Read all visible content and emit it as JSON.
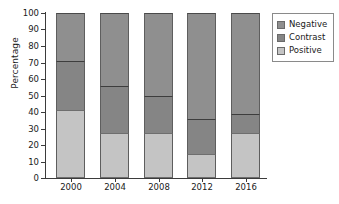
{
  "chart_data": {
    "type": "bar",
    "subtype": "stacked-100-percent",
    "title": "",
    "subtitle": "",
    "xlabel": "",
    "ylabel": "Percentage",
    "categories": [
      "2000",
      "2004",
      "2008",
      "2012",
      "2016"
    ],
    "series": [
      {
        "name": "Positive",
        "color": "#c4c4c4",
        "values": [
          41.0,
          27.0,
          27.5,
          14.5,
          27.0
        ]
      },
      {
        "name": "Contrast",
        "color": "#858585",
        "values": [
          30.0,
          29.0,
          22.5,
          21.5,
          12.0
        ]
      },
      {
        "name": "Negative",
        "color": "#8f8f8f",
        "values": [
          29.0,
          44.0,
          50.0,
          64.0,
          61.0
        ]
      }
    ],
    "stack_order_bottom_to_top": [
      "Positive",
      "Contrast",
      "Negative"
    ],
    "cumulative_tops": {
      "2000": {
        "positive": 41.0,
        "contrast": 71.0,
        "negative": 100.0
      },
      "2004": {
        "positive": 27.0,
        "contrast": 56.0,
        "negative": 100.0
      },
      "2008": {
        "positive": 27.5,
        "contrast": 50.0,
        "negative": 100.0
      },
      "2012": {
        "positive": 14.5,
        "contrast": 36.0,
        "negative": 100.0
      },
      "2016": {
        "positive": 27.0,
        "contrast": 39.0,
        "negative": 100.0
      }
    },
    "ylim": [
      0,
      100
    ],
    "ytick_labels": [
      "0",
      "10",
      "20",
      "30",
      "40",
      "50",
      "60",
      "70",
      "80",
      "90",
      "100"
    ],
    "ytick_values": [
      0,
      10,
      20,
      30,
      40,
      50,
      60,
      70,
      80,
      90,
      100
    ],
    "grid": false,
    "legend_position": "right",
    "legend_order_top_to_bottom": [
      "Negative",
      "Contrast",
      "Positive"
    ],
    "annotations": []
  },
  "axes": {
    "y_title": "Percentage",
    "y_ticks": [
      {
        "label": "100",
        "value": 100
      },
      {
        "label": "90",
        "value": 90
      },
      {
        "label": "80",
        "value": 80
      },
      {
        "label": "70",
        "value": 70
      },
      {
        "label": "60",
        "value": 60
      },
      {
        "label": "50",
        "value": 50
      },
      {
        "label": "40",
        "value": 40
      },
      {
        "label": "30",
        "value": 30
      },
      {
        "label": "20",
        "value": 20
      },
      {
        "label": "10",
        "value": 10
      },
      {
        "label": "0",
        "value": 0
      }
    ],
    "x_ticks": [
      {
        "label": "2000"
      },
      {
        "label": "2004"
      },
      {
        "label": "2008"
      },
      {
        "label": "2012"
      },
      {
        "label": "2016"
      }
    ]
  },
  "legend": {
    "items": [
      {
        "label": "Negative",
        "color": "#8f8f8f"
      },
      {
        "label": "Contrast",
        "color": "#858585"
      },
      {
        "label": "Positive",
        "color": "#c4c4c4"
      }
    ]
  },
  "bars": [
    {
      "category": "2000",
      "positive": 41.0,
      "contrast": 30.0,
      "negative": 29.0
    },
    {
      "category": "2004",
      "positive": 27.0,
      "contrast": 29.0,
      "negative": 44.0
    },
    {
      "category": "2008",
      "positive": 27.5,
      "contrast": 22.5,
      "negative": 50.0
    },
    {
      "category": "2012",
      "positive": 14.5,
      "contrast": 21.5,
      "negative": 64.0
    },
    {
      "category": "2016",
      "positive": 27.0,
      "contrast": 12.0,
      "negative": 61.0
    }
  ]
}
